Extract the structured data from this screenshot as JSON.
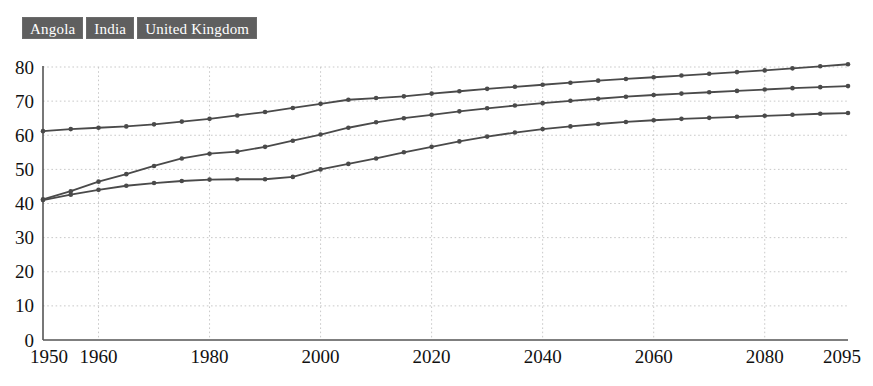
{
  "legend": {
    "items": [
      {
        "label": "Angola"
      },
      {
        "label": "India"
      },
      {
        "label": "United Kingdom"
      }
    ]
  },
  "chart_data": {
    "type": "line",
    "title": "",
    "subtitle": "",
    "xlabel": "",
    "ylabel": "",
    "xlim": [
      1950,
      2095
    ],
    "ylim": [
      0,
      80
    ],
    "grid": true,
    "legend_position": "top-left",
    "x_ticks": [
      1950,
      1960,
      1980,
      2000,
      2020,
      2040,
      2060,
      2080,
      2095
    ],
    "y_ticks": [
      0,
      10,
      20,
      30,
      40,
      50,
      60,
      70,
      80
    ],
    "x": [
      1950,
      1955,
      1960,
      1965,
      1970,
      1975,
      1980,
      1985,
      1990,
      1995,
      2000,
      2005,
      2010,
      2015,
      2020,
      2025,
      2030,
      2035,
      2040,
      2045,
      2050,
      2055,
      2060,
      2065,
      2070,
      2075,
      2080,
      2085,
      2090,
      2095
    ],
    "series": [
      {
        "name": "Angola",
        "color": "#4a4a4a",
        "values": [
          41.0,
          42.6,
          44.0,
          45.2,
          46.0,
          46.6,
          47.0,
          47.1,
          47.1,
          47.8,
          50.0,
          51.6,
          53.2,
          55.0,
          56.6,
          58.2,
          59.6,
          60.8,
          61.8,
          62.6,
          63.3,
          63.9,
          64.4,
          64.8,
          65.1,
          65.4,
          65.7,
          66.0,
          66.3,
          66.5
        ]
      },
      {
        "name": "India",
        "color": "#4a4a4a",
        "values": [
          41.2,
          43.6,
          46.4,
          48.6,
          51.0,
          53.2,
          54.6,
          55.2,
          56.6,
          58.4,
          60.2,
          62.2,
          63.8,
          65.0,
          66.0,
          67.0,
          67.9,
          68.7,
          69.4,
          70.1,
          70.7,
          71.3,
          71.8,
          72.2,
          72.6,
          73.0,
          73.4,
          73.8,
          74.1,
          74.4
        ]
      },
      {
        "name": "United Kingdom",
        "color": "#4a4a4a",
        "values": [
          61.2,
          61.8,
          62.2,
          62.6,
          63.2,
          64.0,
          64.8,
          65.8,
          66.8,
          68.0,
          69.2,
          70.4,
          70.9,
          71.4,
          72.2,
          72.9,
          73.6,
          74.2,
          74.8,
          75.4,
          76.0,
          76.5,
          77.0,
          77.5,
          78.0,
          78.5,
          79.0,
          79.6,
          80.2,
          80.8
        ]
      }
    ]
  }
}
